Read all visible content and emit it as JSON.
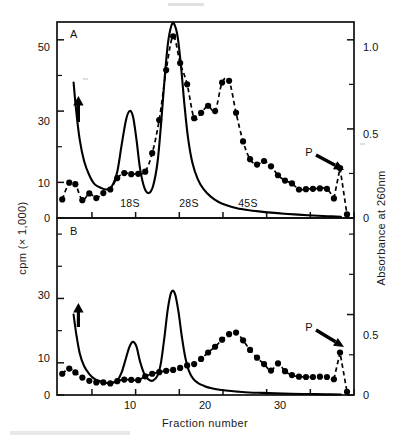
{
  "figure": {
    "x_axis_label": "Fraction number",
    "y_left_label": "cpm (× 1,000)",
    "y_right_label": "Absorbance  at  260nm",
    "panels": [
      {
        "letter": "A",
        "species_labels": [
          "18S",
          "28S",
          "45S"
        ],
        "pellet_label": "P"
      },
      {
        "letter": "B",
        "species_labels": [],
        "pellet_label": "P"
      }
    ]
  },
  "chart_data": {
    "type": "line",
    "title": "",
    "xlabel": "Fraction number",
    "ylabel": "cpm (× 1,000)",
    "y2label": "Absorbance at 260nm",
    "xlim": [
      1,
      35
    ],
    "xticks": [
      5,
      10,
      15,
      20,
      25,
      30,
      35
    ],
    "xticklabels": [
      "",
      "10",
      "",
      "20",
      "",
      "30",
      ""
    ],
    "grid": false,
    "legend": "none",
    "panels": [
      {
        "name": "A",
        "ylim": [
          0,
          55
        ],
        "yticks": [
          0,
          10,
          20,
          30,
          40,
          50
        ],
        "yticklabels": [
          "0",
          "10",
          "",
          "30",
          "",
          "50"
        ],
        "y2lim": [
          0,
          1.1
        ],
        "y2ticks": [
          0,
          0.25,
          0.5,
          0.75,
          1.0
        ],
        "y2ticklabels": [
          "0",
          "",
          "0.5",
          "",
          "1.0"
        ],
        "annotations": [
          {
            "text": "A",
            "type": "panel-letter"
          },
          {
            "text": "18S",
            "x": 9.6,
            "type": "species-marker"
          },
          {
            "text": "28S",
            "x": 14.4,
            "type": "species-marker"
          },
          {
            "text": "45S",
            "x": 19.3,
            "type": "species-marker"
          },
          {
            "text": "P",
            "x": 33.4,
            "type": "pellet-arrow"
          },
          {
            "text": "",
            "x": 3.3,
            "type": "offscale-up-arrow"
          }
        ],
        "series": [
          {
            "name": "cpm",
            "style": "dashed-with-filled-circles",
            "axis": "left",
            "x": [
              1.6,
              2.4,
              3.1,
              3.9,
              4.7,
              5.5,
              6.3,
              7.1,
              7.9,
              8.7,
              9.5,
              10.3,
              11.1,
              11.9,
              12.7,
              13.5,
              14.3,
              15.1,
              15.9,
              16.7,
              17.5,
              18.3,
              19.1,
              19.9,
              20.7,
              21.5,
              22.3,
              23.1,
              23.9,
              24.7,
              25.5,
              26.3,
              27.1,
              27.9,
              28.7,
              29.5,
              30.3,
              31.1,
              31.9,
              32.7,
              33.4,
              34.2
            ],
            "y": [
              5.2,
              9.9,
              9.5,
              5.0,
              6.9,
              5.6,
              7.0,
              8.0,
              11.2,
              12.6,
              12.3,
              12.4,
              13.0,
              18.2,
              27.5,
              41.5,
              51.0,
              43.5,
              37.5,
              28.0,
              29.5,
              31.5,
              30.0,
              38.0,
              38.5,
              29.5,
              21.5,
              16.5,
              15.0,
              16.0,
              14.5,
              12.0,
              10.5,
              9.7,
              8.0,
              8.1,
              8.2,
              8.3,
              8.2,
              5.5,
              14.0,
              1.0
            ]
          },
          {
            "name": "absorbance",
            "style": "solid",
            "axis": "right",
            "x": [
              2.9,
              3.2,
              3.6,
              4.1,
              4.7,
              5.3,
              6.0,
              6.7,
              7.3,
              7.9,
              8.4,
              8.9,
              9.3,
              9.7,
              10.1,
              10.5,
              11.0,
              11.5,
              12.0,
              12.5,
              12.9,
              13.3,
              13.7,
              14.1,
              14.4,
              14.8,
              15.2,
              15.6,
              16.0,
              16.5,
              17.1,
              17.8,
              18.6,
              19.5,
              20.5,
              21.6,
              22.8,
              24.1,
              25.5,
              27.0,
              28.6,
              30.3,
              32.0,
              33.5
            ],
            "y": [
              0.76,
              0.6,
              0.44,
              0.32,
              0.24,
              0.19,
              0.17,
              0.16,
              0.18,
              0.26,
              0.41,
              0.55,
              0.6,
              0.57,
              0.44,
              0.28,
              0.17,
              0.14,
              0.18,
              0.31,
              0.52,
              0.77,
              0.98,
              1.08,
              1.09,
              1.02,
              0.85,
              0.63,
              0.45,
              0.31,
              0.22,
              0.16,
              0.12,
              0.09,
              0.07,
              0.055,
              0.045,
              0.037,
              0.03,
              0.024,
              0.019,
              0.014,
              0.01,
              0.007
            ]
          }
        ]
      },
      {
        "name": "B",
        "ylim": [
          0,
          55
        ],
        "yticks": [
          0,
          10,
          20,
          30,
          40,
          50
        ],
        "yticklabels": [
          "0",
          "10",
          "",
          "30",
          "",
          ""
        ],
        "y2lim": [
          0,
          1.1
        ],
        "y2ticks": [
          0,
          0.25,
          0.5,
          0.75,
          1.0
        ],
        "y2ticklabels": [
          "0",
          "",
          "0.5",
          "",
          ""
        ],
        "annotations": [
          {
            "text": "B",
            "type": "panel-letter"
          },
          {
            "text": "P",
            "x": 33.4,
            "type": "pellet-arrow"
          },
          {
            "text": "",
            "x": 3.3,
            "type": "offscale-up-arrow"
          }
        ],
        "series": [
          {
            "name": "cpm",
            "style": "dashed-with-filled-circles",
            "axis": "left",
            "x": [
              1.6,
              2.4,
              3.1,
              3.9,
              4.7,
              5.5,
              6.3,
              7.1,
              7.9,
              8.7,
              9.5,
              10.3,
              11.1,
              11.9,
              12.7,
              13.5,
              14.3,
              15.1,
              15.9,
              16.7,
              17.5,
              18.3,
              19.1,
              19.9,
              20.7,
              21.5,
              22.3,
              23.1,
              23.9,
              24.7,
              25.5,
              26.3,
              27.1,
              27.9,
              28.7,
              29.5,
              30.3,
              31.1,
              31.9,
              32.7,
              33.4,
              34.2
            ],
            "y": [
              6.6,
              8.2,
              7.0,
              5.4,
              4.4,
              3.9,
              3.9,
              3.6,
              4.3,
              4.8,
              4.7,
              4.6,
              5.8,
              6.6,
              7.1,
              7.5,
              7.8,
              8.4,
              9.2,
              9.6,
              11.2,
              13.2,
              15.0,
              17.2,
              18.9,
              19.4,
              17.0,
              14.0,
              11.6,
              9.6,
              7.6,
              9.8,
              7.4,
              6.2,
              5.7,
              5.6,
              5.6,
              5.7,
              5.6,
              4.9,
              13.2,
              1.0
            ]
          },
          {
            "name": "absorbance",
            "style": "solid",
            "axis": "right",
            "x": [
              2.9,
              3.2,
              3.6,
              4.1,
              4.7,
              5.3,
              6.0,
              6.7,
              7.3,
              7.9,
              8.4,
              8.9,
              9.3,
              9.7,
              10.1,
              10.5,
              11.0,
              11.5,
              12.0,
              12.5,
              12.9,
              13.3,
              13.7,
              14.1,
              14.5,
              14.9,
              15.3,
              15.7,
              16.1,
              16.6,
              17.2,
              17.9,
              18.7,
              19.6,
              20.6,
              21.7,
              23.0,
              24.4,
              26.0,
              27.8,
              29.8,
              31.8,
              33.5
            ],
            "y": [
              0.5,
              0.38,
              0.26,
              0.18,
              0.13,
              0.1,
              0.085,
              0.075,
              0.075,
              0.09,
              0.14,
              0.23,
              0.3,
              0.33,
              0.3,
              0.21,
              0.13,
              0.095,
              0.09,
              0.12,
              0.2,
              0.36,
              0.54,
              0.64,
              0.63,
              0.52,
              0.36,
              0.23,
              0.15,
              0.1,
              0.072,
              0.055,
              0.042,
              0.033,
              0.026,
              0.021,
              0.016,
              0.013,
              0.01,
              0.008,
              0.006,
              0.004,
              0.003
            ]
          }
        ]
      }
    ]
  }
}
